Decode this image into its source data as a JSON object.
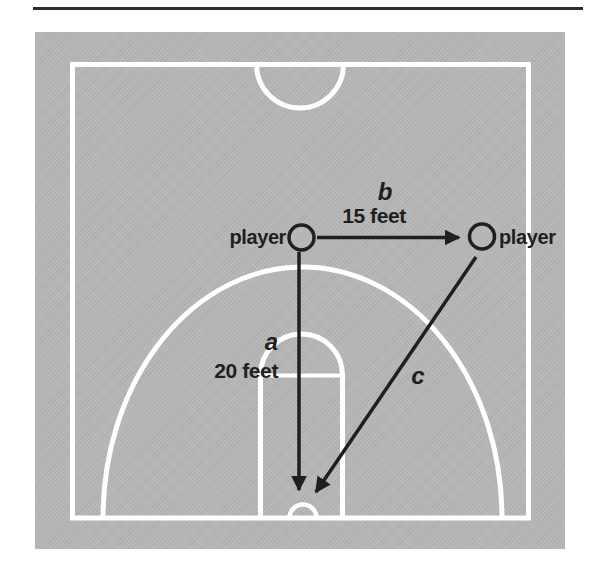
{
  "figure": {
    "type": "basketball-court-diagram",
    "labels": {
      "player_left": "player",
      "player_right": "player",
      "side_a_name": "a",
      "side_a_length": "20 feet",
      "side_b_name": "b",
      "side_b_length": "15 feet",
      "side_c_name": "c"
    },
    "colors": {
      "court": "#b6b6b6",
      "lines": "#ffffff",
      "ink": "#1f1f1f",
      "page": "#ffffff",
      "rule": "#2e2e2e"
    }
  }
}
